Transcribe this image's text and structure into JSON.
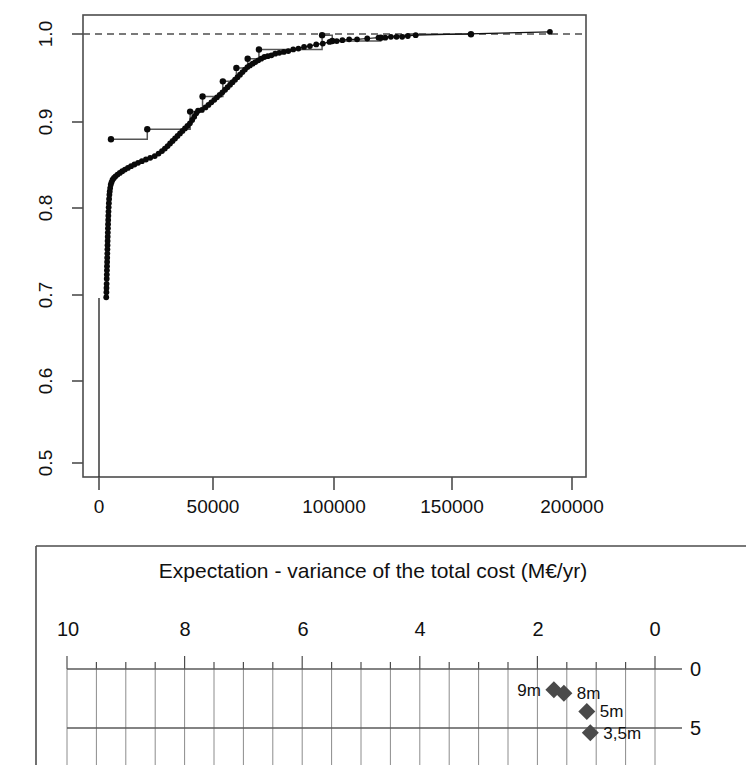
{
  "chart_data": [
    {
      "type": "line",
      "name": "empirical-cumulative-distribution",
      "title": "",
      "xlabel": "",
      "ylabel": "",
      "xlim": [
        -10000,
        213000
      ],
      "ylim": [
        0.47,
        1.02
      ],
      "xticks": [
        0,
        50000,
        100000,
        150000,
        200000
      ],
      "xticklabels": [
        "0",
        "50000",
        "100000",
        "150000",
        "200000"
      ],
      "yticks": [
        0.5,
        0.6,
        0.7,
        0.8,
        0.9,
        1.0
      ],
      "yticklabels": [
        "0.5",
        "0.6",
        "0.7",
        "0.8",
        "0.9",
        "1.0"
      ],
      "grid": false,
      "legend": "none",
      "reference_line": {
        "orientation": "horizontal",
        "y": 1.0,
        "style": "dashed"
      },
      "series": [
        {
          "name": "dotted-ecdf",
          "marker": "filled-circle",
          "points": [
            [
              300,
              0.684
            ],
            [
              380,
              0.69
            ],
            [
              420,
              0.695
            ],
            [
              470,
              0.7
            ],
            [
              520,
              0.706
            ],
            [
              560,
              0.711
            ],
            [
              600,
              0.716
            ],
            [
              640,
              0.721
            ],
            [
              690,
              0.726
            ],
            [
              730,
              0.731
            ],
            [
              780,
              0.736
            ],
            [
              820,
              0.741
            ],
            [
              870,
              0.746
            ],
            [
              910,
              0.751
            ],
            [
              960,
              0.756
            ],
            [
              1010,
              0.761
            ],
            [
              1060,
              0.766
            ],
            [
              1110,
              0.771
            ],
            [
              1170,
              0.776
            ],
            [
              1230,
              0.781
            ],
            [
              1300,
              0.786
            ],
            [
              1380,
              0.791
            ],
            [
              1470,
              0.796
            ],
            [
              1570,
              0.801
            ],
            [
              1700,
              0.806
            ],
            [
              1850,
              0.81
            ],
            [
              2050,
              0.814
            ],
            [
              2300,
              0.818
            ],
            [
              2650,
              0.821
            ],
            [
              3100,
              0.824
            ],
            [
              3700,
              0.826
            ],
            [
              4400,
              0.828
            ],
            [
              5300,
              0.83
            ],
            [
              6300,
              0.832
            ],
            [
              7400,
              0.834
            ],
            [
              8600,
              0.836
            ],
            [
              9900,
              0.838
            ],
            [
              11300,
              0.84
            ],
            [
              12800,
              0.842
            ],
            [
              14400,
              0.844
            ],
            [
              16100,
              0.846
            ],
            [
              17900,
              0.848
            ],
            [
              19800,
              0.85
            ],
            [
              21800,
              0.852
            ],
            [
              23500,
              0.855
            ],
            [
              25000,
              0.858
            ],
            [
              26300,
              0.861
            ],
            [
              27500,
              0.864
            ],
            [
              28600,
              0.867
            ],
            [
              29700,
              0.87
            ],
            [
              30800,
              0.873
            ],
            [
              31900,
              0.876
            ],
            [
              33000,
              0.879
            ],
            [
              34100,
              0.882
            ],
            [
              35200,
              0.885
            ],
            [
              36300,
              0.888
            ],
            [
              37400,
              0.891
            ],
            [
              38400,
              0.895
            ],
            [
              39300,
              0.899
            ],
            [
              40200,
              0.903
            ],
            [
              41000,
              0.906
            ],
            [
              42700,
              0.907
            ],
            [
              44300,
              0.91
            ],
            [
              45600,
              0.913
            ],
            [
              46900,
              0.916
            ],
            [
              48200,
              0.919
            ],
            [
              49400,
              0.922
            ],
            [
              50600,
              0.925
            ],
            [
              51800,
              0.928
            ],
            [
              53000,
              0.931
            ],
            [
              54100,
              0.934
            ],
            [
              55200,
              0.937
            ],
            [
              56300,
              0.94
            ],
            [
              57400,
              0.943
            ],
            [
              58500,
              0.946
            ],
            [
              59600,
              0.949
            ],
            [
              60700,
              0.952
            ],
            [
              61800,
              0.955
            ],
            [
              62900,
              0.958
            ],
            [
              64000,
              0.96
            ],
            [
              65200,
              0.962
            ],
            [
              66400,
              0.964
            ],
            [
              67700,
              0.966
            ],
            [
              69000,
              0.968
            ],
            [
              70400,
              0.97
            ],
            [
              71900,
              0.971
            ],
            [
              73500,
              0.972
            ],
            [
              75200,
              0.974
            ],
            [
              77000,
              0.975
            ],
            [
              79000,
              0.976
            ],
            [
              81000,
              0.977
            ],
            [
              83200,
              0.979
            ],
            [
              85500,
              0.98
            ],
            [
              88000,
              0.982
            ],
            [
              90600,
              0.983
            ],
            [
              93400,
              0.985
            ],
            [
              96300,
              0.986
            ],
            [
              99300,
              0.988
            ],
            [
              102500,
              0.989
            ],
            [
              105000,
              0.99
            ],
            [
              108000,
              0.991
            ],
            [
              111500,
              0.991
            ],
            [
              116000,
              0.992
            ],
            [
              121000,
              0.993
            ],
            [
              124000,
              0.993
            ],
            [
              126500,
              0.994
            ],
            [
              129000,
              0.994
            ],
            [
              131500,
              0.994
            ],
            [
              134000,
              0.995
            ],
            [
              137500,
              0.996
            ],
            [
              197000,
              1.0
            ]
          ]
        },
        {
          "name": "step-ecdf",
          "marker": "filled-circle",
          "points": [
            [
              2400,
              0.872
            ],
            [
              18500,
              0.872
            ],
            [
              18500,
              0.884
            ],
            [
              37500,
              0.884
            ],
            [
              37500,
              0.905
            ],
            [
              43000,
              0.905
            ],
            [
              43000,
              0.923
            ],
            [
              52000,
              0.923
            ],
            [
              52000,
              0.941
            ],
            [
              58000,
              0.941
            ],
            [
              58000,
              0.957
            ],
            [
              63000,
              0.957
            ],
            [
              63000,
              0.968
            ],
            [
              68000,
              0.968
            ],
            [
              68000,
              0.979
            ],
            [
              96000,
              0.979
            ],
            [
              96000,
              0.996
            ],
            [
              100500,
              0.996
            ],
            [
              100500,
              0.989
            ],
            [
              122000,
              0.989
            ],
            [
              122000,
              0.993
            ],
            [
              137000,
              0.997
            ],
            [
              162000,
              0.997
            ]
          ]
        }
      ]
    },
    {
      "type": "scatter",
      "name": "expectation-variance-total-cost",
      "title": "Expectation - variance of the total cost (M€/yr)",
      "xlabel": "",
      "ylabel": "",
      "x_axis_position": "top",
      "x_axis_reversed": true,
      "xlim": [
        10,
        0
      ],
      "ylim": [
        0,
        7
      ],
      "xticks": [
        10,
        8,
        6,
        4,
        2,
        0
      ],
      "xticklabels": [
        "10",
        "8",
        "6",
        "4",
        "2",
        "0"
      ],
      "x_minor_tick_step": 0.5,
      "yticks": [
        0,
        5
      ],
      "yticklabels": [
        "0",
        "5"
      ],
      "y_axis_position": "right",
      "grid": true,
      "legend": "none",
      "points": [
        {
          "label": "9m",
          "x": 1.72,
          "y": 1.75,
          "label_side": "left"
        },
        {
          "label": "8m",
          "x": 1.55,
          "y": 2.05,
          "label_side": "right"
        },
        {
          "label": "5m",
          "x": 1.16,
          "y": 3.6,
          "label_side": "right"
        },
        {
          "label": "3,5m",
          "x": 1.1,
          "y": 5.4,
          "label_side": "right"
        }
      ]
    }
  ],
  "top_chart": {
    "name": "ecdf-plot",
    "xticklabels": [
      "0",
      "50000",
      "100000",
      "150000",
      "200000"
    ],
    "yticklabels": [
      "0.5",
      "0.6",
      "0.7",
      "0.8",
      "0.9",
      "1.0"
    ]
  },
  "bottom_chart": {
    "name": "expectation-variance-plot",
    "title": "Expectation - variance of the total cost (M€/yr)",
    "xticklabels": [
      "10",
      "8",
      "6",
      "4",
      "2",
      "0"
    ],
    "yticklabels": [
      "0",
      "5"
    ],
    "point_labels": [
      "9m",
      "8m",
      "5m",
      "3,5m"
    ]
  },
  "colors": {
    "axis": "#4d4d4d",
    "grid": "#8c8c8c",
    "marker": "#000000",
    "diamond": "#4a4a4a",
    "text": "#111111",
    "background": "#ffffff"
  }
}
